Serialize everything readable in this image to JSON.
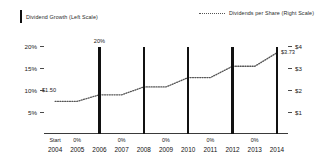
{
  "legend": {
    "left": {
      "label": "Dividend Growth (Left Scale)",
      "marker": "bar-swatch-icon",
      "color": "#111111"
    },
    "right": {
      "label": "Dividends per Share (Right Scale)",
      "marker": "dotted-line-swatch-icon",
      "color": "#555555"
    }
  },
  "axes": {
    "left_ticks": [
      "20%",
      "15%",
      "10%",
      "5%"
    ],
    "right_ticks": [
      "$4",
      "$3",
      "$2",
      "$1"
    ]
  },
  "annotations": {
    "bar_peak": "20%",
    "line_start": "$1.50",
    "line_end": "$3.73"
  },
  "chart_data": {
    "type": "bar",
    "title": "",
    "subtitle": "",
    "xlabel": "",
    "ylabel": "Dividend Growth (Left Scale)",
    "y2label": "Dividends per Share (Right Scale)",
    "grid": false,
    "legend_position": "top",
    "categories": [
      "2004",
      "2005",
      "2006",
      "2007",
      "2008",
      "2009",
      "2010",
      "2011",
      "2012",
      "2013",
      "2014"
    ],
    "category_sublabels": [
      "Start",
      "0%",
      "",
      "0%",
      "",
      "0%",
      "",
      "0%",
      "",
      "0%",
      ""
    ],
    "ylim": [
      0,
      22.5
    ],
    "yticks": [
      5,
      10,
      15,
      20
    ],
    "ytick_labels": [
      "5%",
      "10%",
      "15%",
      "20%"
    ],
    "y2lim": [
      0,
      4.5
    ],
    "y2ticks": [
      1,
      2,
      3,
      4
    ],
    "y2tick_labels": [
      "$1",
      "$2",
      "$3",
      "$4"
    ],
    "series": [
      {
        "name": "Dividend Growth (Left Scale)",
        "type": "bar",
        "axis": "left",
        "unit": "%",
        "color": "#111111",
        "values": [
          0,
          0,
          20,
          0,
          20,
          0,
          20,
          0,
          20,
          0,
          20
        ],
        "data_labels": [
          "",
          "0%",
          "20%",
          "0%",
          "",
          "0%",
          "",
          "0%",
          "",
          "0%",
          ""
        ]
      },
      {
        "name": "Dividends per Share (Right Scale)",
        "type": "line",
        "style": "dotted",
        "axis": "right",
        "unit": "$",
        "color": "#555555",
        "values": [
          1.5,
          1.5,
          1.8,
          1.8,
          2.16,
          2.16,
          2.59,
          2.59,
          3.11,
          3.11,
          3.73
        ],
        "endpoint_labels": {
          "first": "$1.50",
          "last": "$3.73"
        }
      }
    ]
  }
}
